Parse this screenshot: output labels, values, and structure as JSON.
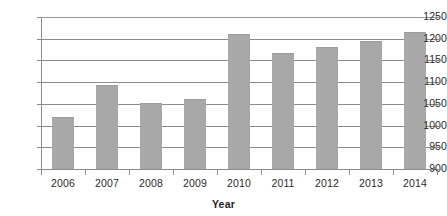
{
  "chart_data": {
    "type": "bar",
    "title": "",
    "xlabel": "Year",
    "ylabel": "",
    "categories": [
      "2006",
      "2007",
      "2008",
      "2009",
      "2010",
      "2011",
      "2012",
      "2013",
      "2014"
    ],
    "values": [
      1020,
      1093,
      1052,
      1062,
      1210,
      1166,
      1180,
      1194,
      1215
    ],
    "series": [
      {
        "name": "",
        "values": [
          1020,
          1093,
          1052,
          1062,
          1210,
          1166,
          1180,
          1194,
          1215
        ]
      }
    ],
    "ylim": [
      900,
      1250
    ],
    "ytick_labels": [
      "1250",
      "1200",
      "1150",
      "1100",
      "1050",
      "1000",
      "950",
      "900"
    ],
    "ytick_values": [
      1250,
      1200,
      1150,
      1100,
      1050,
      1000,
      950,
      900
    ],
    "grid": true,
    "legend": "none",
    "bar_color": "#a8a8a8",
    "gridline_color": "#8c8c8c",
    "axis_color": "#8c8c8c",
    "text_color": "#2b2b2b",
    "background": "#ffffff"
  }
}
